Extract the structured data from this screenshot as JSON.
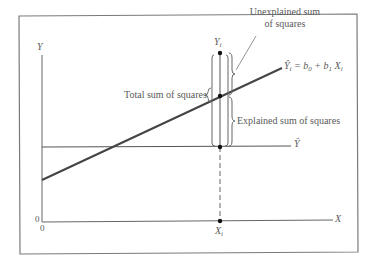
{
  "diagram": {
    "title": "",
    "axes": {
      "y_label": "Y",
      "x_label": "X",
      "y_origin_label": "0",
      "x_origin_label": "0"
    },
    "lines": {
      "mean_label": "Ȳ",
      "regression_label_lhs": "Ŷ",
      "regression_label_lhs_sub": "i",
      "regression_label_eq": "= b",
      "regression_b0_sub": "0",
      "regression_plus": " + b",
      "regression_b1_sub": "1",
      "regression_x": "X",
      "regression_x_sub": "i"
    },
    "points": {
      "yi_label": "Y",
      "yi_sub": "i",
      "xi_label": "X",
      "xi_sub": "i"
    },
    "annotations": {
      "unexplained_line1": "Unexplained sum",
      "unexplained_line2": "of squares",
      "total": "Total sum of squares",
      "explained": "Explained sum of squares"
    },
    "colors": {
      "frame": "#777777",
      "axes": "#666666",
      "regression": "#444444",
      "text": "#5a5a5a",
      "points": "#111111"
    }
  }
}
